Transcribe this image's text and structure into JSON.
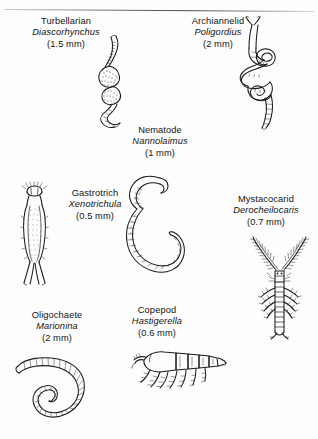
{
  "figure": {
    "caption_rule": true,
    "background": "#fdfdfd",
    "ink_color": "#1b1b1b",
    "organisms": [
      {
        "id": "turbellarian",
        "common_name": "Turbellarian",
        "genus": "Diascorhynchus",
        "size": "(1.5 mm)",
        "drawing": "vertical sinuous flatworm with stippled granular midbody"
      },
      {
        "id": "archiannelid",
        "common_name": "Archiannelid",
        "genus": "Poligordius",
        "size": "(2 mm)",
        "drawing": "long coiled worm with forked head tentacles and looping coils"
      },
      {
        "id": "nematode",
        "common_name": "Nematode",
        "genus": "Nannolaimus",
        "size": "(1 mm)",
        "drawing": "smooth hook shaped curled roundworm"
      },
      {
        "id": "gastrotrich",
        "common_name": "Gastrotrich",
        "genus": "Xenotrichula",
        "size": "(0.5 mm)",
        "drawing": "elongated stippled body with lobed head and forked adhesive tubes"
      },
      {
        "id": "mystacocarid",
        "common_name": "Mystacocarid",
        "genus": "Derocheilocaris",
        "size": "(0.7 mm)",
        "drawing": "segmented crustacean with long branched antennae and lateral setae"
      },
      {
        "id": "oligochaete",
        "common_name": "Oligochaete",
        "genus": "Marionina",
        "size": "(2 mm)",
        "drawing": "annulated segmented worm curled into a spiral"
      },
      {
        "id": "copepod",
        "common_name": "Copepod",
        "genus": "Hastigerella",
        "size": "(0.6 mm)",
        "drawing": "horizontal segmented copepod with swimming legs and antennae"
      }
    ]
  }
}
